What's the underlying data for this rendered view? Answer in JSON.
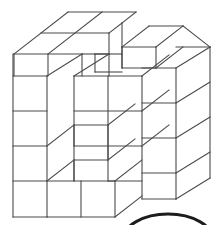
{
  "figure": {
    "title": "Isometric unit-cube block figure",
    "type": "line-drawing",
    "shape_kind": "cube-stack",
    "projection": "isometric",
    "colors": {
      "background": "#ffffff",
      "edge_stroke": "#4a4a4a",
      "face_fill": "#ffffff",
      "arc_stroke": "#1d1d1d"
    },
    "grid": {
      "columns": 4,
      "rows": 4,
      "depth": 4,
      "cube_width_px": 34,
      "cube_height_px": 35,
      "iso_dx_px": 27,
      "iso_dy_px": -21
    },
    "geometry": {
      "origin": {
        "x": 13,
        "y": 76
      },
      "bottom_left": {
        "x": 13,
        "y": 217
      },
      "top_apex": {
        "x": 68,
        "y": 12
      },
      "right_edge_x": 210,
      "notch": {
        "present": true,
        "location": "top-middle",
        "removed_cubes": 2
      },
      "front_step": {
        "present": true,
        "location": "front-left-lower",
        "removed_cubes": 1
      }
    },
    "arc": {
      "present": true,
      "label": "partial-ellipse-arc",
      "center": {
        "x": 168,
        "y": 240
      },
      "radius_x": 45,
      "radius_y": 26,
      "clipped": true,
      "clip_note": "Only the top crown of the arc is visible at the bottom edge of the image."
    }
  }
}
